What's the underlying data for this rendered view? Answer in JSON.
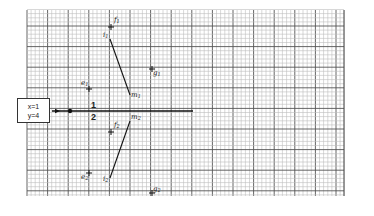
{
  "diagram": {
    "type": "graph-paper construction diagram",
    "grid": {
      "x_start": 27,
      "x_end": 344,
      "y_start": 10,
      "y_end": 196,
      "minor_step": 4.12,
      "major_every": 5,
      "minor_color": "#bdbdbd",
      "major_color": "#555555"
    },
    "state_box": {
      "line1": "x=1",
      "line2": "y=4"
    },
    "axis": {
      "label_top": "1",
      "label_bottom": "2",
      "y": 111,
      "x_start": 52,
      "x_end": 193,
      "arrow_x": 60,
      "dot_x": 70
    },
    "points": {
      "f1": {
        "label": "f",
        "sub": "1",
        "x": 111,
        "y": 27
      },
      "i1": {
        "label": "i",
        "sub": "1",
        "x": 110,
        "y": 39
      },
      "g1": {
        "label": "g",
        "sub": "1",
        "x": 152,
        "y": 69
      },
      "m1": {
        "label": "m",
        "sub": "1",
        "x": 130,
        "y": 95
      },
      "e1": {
        "label": "e",
        "sub": "1",
        "x": 89,
        "y": 89
      },
      "f2": {
        "label": "f",
        "sub": "2",
        "x": 111,
        "y": 132
      },
      "m2": {
        "label": "m",
        "sub": "2",
        "x": 130,
        "y": 121
      },
      "e2": {
        "label": "e",
        "sub": "2",
        "x": 89,
        "y": 173
      },
      "i2": {
        "label": "i",
        "sub": "2",
        "x": 110,
        "y": 178
      },
      "g2": {
        "label": "g",
        "sub": "2",
        "x": 152,
        "y": 193
      }
    },
    "segments": [
      {
        "from": "i1",
        "to": "m1"
      },
      {
        "from": "i2",
        "to": "m2"
      }
    ]
  }
}
